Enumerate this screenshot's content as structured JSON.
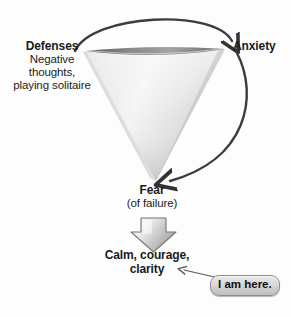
{
  "diagram": {
    "background_color": "#fdfdfd",
    "nodes": {
      "defenses": {
        "heading": "Defenses",
        "detail_line_1": "Negative",
        "detail_line_2": "thoughts,",
        "detail_line_3": "playing solitaire"
      },
      "anxiety": {
        "label": "Anxiety"
      },
      "fear": {
        "heading": "Fear",
        "detail": "(of failure)"
      },
      "outcome": {
        "line_1": "Calm, courage,",
        "line_2": "clarity"
      },
      "callout": {
        "label": "I am here."
      }
    },
    "shapes": {
      "funnel": {
        "name": "inverted-cone-funnel",
        "fill_top": "#efefef",
        "fill_bottom": "#d3d3d3",
        "rim_color": "#5c5c5c"
      },
      "block_arrow": {
        "name": "down-block-arrow",
        "fill_light": "#f0f0f0",
        "fill_dark": "#9d9d9d",
        "stroke": "#6f6f6f"
      }
    },
    "connectors": {
      "top_arc": {
        "name": "defenses-to-anxiety-arc",
        "from": "Defenses",
        "to": "Anxiety",
        "color": "#3c3c3c"
      },
      "right_arc": {
        "name": "anxiety-to-fear-arc",
        "from": "Anxiety",
        "to": "Fear",
        "color": "#3c3c3c"
      },
      "callout_pointer": {
        "name": "callout-to-outcome-arrow",
        "from": "I am here.",
        "to": "clarity",
        "color": "#5a5a5a"
      }
    }
  }
}
